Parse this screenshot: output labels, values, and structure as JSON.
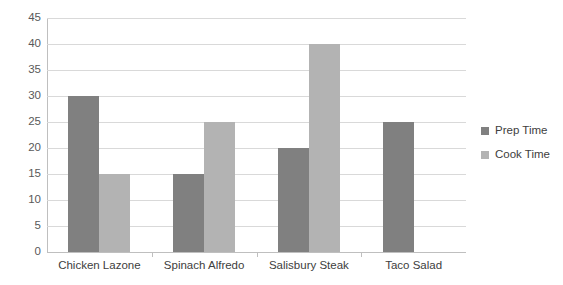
{
  "chart_data": {
    "type": "bar",
    "title": "",
    "subtitle": "",
    "xlabel": "",
    "ylabel": "",
    "categories": [
      "Chicken Lazone",
      "Spinach Alfredo",
      "Salisbury Steak",
      "Taco Salad"
    ],
    "series": [
      {
        "name": "Prep Time",
        "color": "#808080",
        "values": [
          30,
          15,
          20,
          25
        ]
      },
      {
        "name": "Cook Time",
        "color": "#b3b3b3",
        "values": [
          15,
          25,
          40,
          null
        ]
      }
    ],
    "ylim": [
      0,
      45
    ],
    "ytick_step": 5,
    "yticks": [
      45,
      40,
      35,
      30,
      25,
      20,
      15,
      10,
      5,
      0
    ],
    "ytick_labels": [
      "45",
      "40",
      "35",
      "30",
      "25",
      "20",
      "15",
      "10",
      "5",
      "0"
    ],
    "grid": true,
    "grid_axis": "y",
    "legend_position": "right",
    "legend": [
      "Prep Time",
      "Cook Time"
    ],
    "annotations": []
  },
  "style": {
    "background": "#ffffff",
    "gridline_color": "#d9d9d9",
    "axis_color": "#bfbfbf",
    "tick_label_color": "#595959",
    "category_label_color": "#404040",
    "legend_text_color": "#404040"
  }
}
